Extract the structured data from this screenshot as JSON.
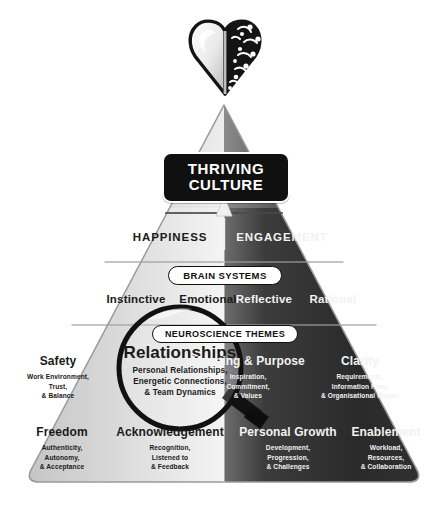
{
  "diagram": {
    "icon_name": "heart-brain-icon",
    "colors": {
      "light_side": "#d9d9d9",
      "dark_side": "#2b2b2b",
      "badge_bg": "#101010",
      "badge_text": "#ffffff",
      "pill_bg": "#ffffff",
      "pill_text": "#101010"
    },
    "apex_badge": {
      "line1": "THRIVING",
      "line2": "CULTURE"
    },
    "outcomes": {
      "left": "HAPPINESS",
      "right": "ENGAGEMENT"
    },
    "brain_systems": {
      "pill": "BRAIN SYSTEMS",
      "items": [
        "Instinctive",
        "Emotional",
        "Reflective",
        "Rational"
      ]
    },
    "neuroscience_themes": {
      "pill": "NEUROSCIENCE THEMES",
      "upper_row": [
        {
          "title": "Safety",
          "sub": [
            "Work Environment,",
            "Trust,",
            "& Balance"
          ],
          "side": "light"
        },
        {
          "title": "Relationships",
          "sub": [
            "Personal Relationships,",
            "Energetic Connections,",
            "& Team Dynamics"
          ],
          "side": "light",
          "highlighted": "true"
        },
        {
          "title": "Meaning & Purpose",
          "sub": [
            "Inspiration,",
            "Commitment,",
            "& Values"
          ],
          "side": "dark"
        },
        {
          "title": "Clarity",
          "sub": [
            "Requirements,",
            "Information Flow,",
            "& Organisational Impact"
          ],
          "side": "dark"
        }
      ],
      "lower_row": [
        {
          "title": "Freedom",
          "sub": [
            "Authenticity,",
            "Autonomy,",
            "& Acceptance"
          ],
          "side": "light"
        },
        {
          "title": "Acknowledgement",
          "sub": [
            "Recognition,",
            "Listened to",
            "& Feedback"
          ],
          "side": "light"
        },
        {
          "title": "Personal Growth",
          "sub": [
            "Development,",
            "Progression,",
            "& Challenges"
          ],
          "side": "dark"
        },
        {
          "title": "Enablement",
          "sub": [
            "Workload,",
            "Resources,",
            "& Collaboration"
          ],
          "side": "dark"
        }
      ]
    },
    "magnifier": {
      "name": "magnifying-glass-over-relationships"
    },
    "arrow": {
      "name": "upward-arrow-to-thriving-culture"
    }
  }
}
